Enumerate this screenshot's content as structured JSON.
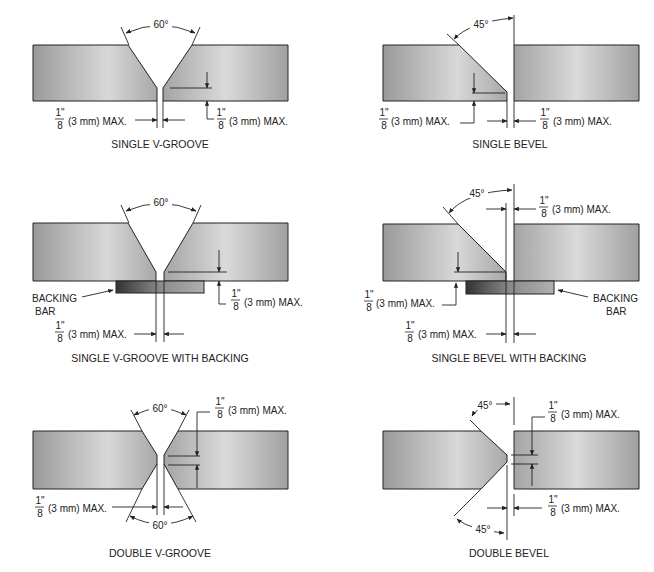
{
  "figure": {
    "panels": [
      {
        "id": "single-v-groove",
        "caption": "SINGLE V-GROOVE",
        "angle_label": "60°",
        "root_opening": {
          "num": "1\"",
          "den": "8",
          "text": "(3 mm) MAX."
        },
        "root_face": {
          "num": "1\"",
          "den": "8",
          "text": "(3 mm) MAX."
        }
      },
      {
        "id": "single-bevel",
        "caption": "SINGLE BEVEL",
        "angle_label": "45°",
        "root_face": {
          "num": "1\"",
          "den": "8",
          "text": "(3 mm) MAX."
        },
        "root_opening": {
          "num": "1\"",
          "den": "8",
          "text": "(3 mm) MAX."
        }
      },
      {
        "id": "single-v-groove-with-backing",
        "caption": "SINGLE V-GROOVE WITH BACKING",
        "angle_label": "60°",
        "backing_label_1": "BACKING",
        "backing_label_2": "BAR",
        "root_face": {
          "num": "1\"",
          "den": "8",
          "text": "(3 mm) MAX."
        },
        "root_opening": {
          "num": "1\"",
          "den": "8",
          "text": "(3 mm) MAX."
        }
      },
      {
        "id": "single-bevel-with-backing",
        "caption": "SINGLE BEVEL WITH BACKING",
        "angle_label": "45°",
        "backing_label_1": "BACKING",
        "backing_label_2": "BAR",
        "top_dim": {
          "num": "1\"",
          "den": "8",
          "text": "(3 mm) MAX."
        },
        "root_face": {
          "num": "1\"",
          "den": "8",
          "text": "(3 mm) MAX."
        },
        "root_opening": {
          "num": "1\"",
          "den": "8",
          "text": "(3 mm) MAX."
        }
      },
      {
        "id": "double-v-groove",
        "caption": "DOUBLE V-GROOVE",
        "angle_top": "60°",
        "angle_bottom": "60°",
        "root_face": {
          "num": "1\"",
          "den": "8",
          "text": "(3 mm) MAX."
        },
        "root_opening": {
          "num": "1\"",
          "den": "8",
          "text": "(3 mm) MAX."
        }
      },
      {
        "id": "double-bevel",
        "caption": "DOUBLE BEVEL",
        "angle_top": "45°",
        "angle_bottom": "45°",
        "root_face": {
          "num": "1\"",
          "den": "8",
          "text": "(3 mm) MAX."
        },
        "root_opening": {
          "num": "1\"",
          "den": "8",
          "text": "(3 mm) MAX."
        }
      }
    ]
  }
}
